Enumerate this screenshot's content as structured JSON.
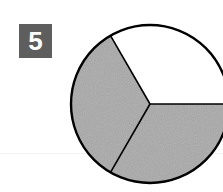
{
  "problem": {
    "number_label": "5",
    "badge_color": "#5e5e5e"
  },
  "figure": {
    "type": "fraction-circle",
    "total_parts": 3,
    "shaded_parts": 2,
    "shaded_color": "#a9a9a9",
    "unshaded_color": "#ffffff",
    "outline_color": "#000000"
  }
}
